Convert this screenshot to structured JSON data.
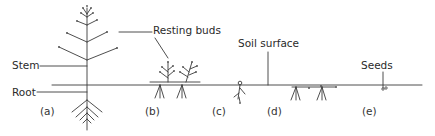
{
  "figure": {
    "type": "botanical-diagram"
  },
  "labels": {
    "stem": "Stem",
    "root": "Root",
    "resting_buds": "Resting buds",
    "soil_surface": "Soil surface",
    "seeds": "Seeds"
  },
  "panels": [
    {
      "id": "a",
      "label": "(a)",
      "description": "Tall plant with resting buds high above soil"
    },
    {
      "id": "b",
      "label": "(b)",
      "description": "Low shoots with buds close to soil surface"
    },
    {
      "id": "c",
      "label": "(c)",
      "description": "Bud at soil surface"
    },
    {
      "id": "d",
      "label": "(d)",
      "description": "Buds below soil on rhizome"
    },
    {
      "id": "e",
      "label": "(e)",
      "description": "Survives as seeds"
    }
  ],
  "colors": {
    "line": "#3a3a3a",
    "text": "#2a2a2a",
    "background": "#ffffff"
  }
}
